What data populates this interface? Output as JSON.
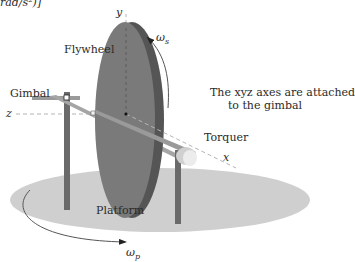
{
  "header_fragment": "rad/s²)]",
  "labels": {
    "flywheel": "Flywheel",
    "gimbal": "Gimbal",
    "torquer": "Torquer",
    "platform": "Platform",
    "note_line1": "The xyz axes are attached",
    "note_line2": "to the gimbal"
  },
  "axes": {
    "x": "x",
    "y": "y",
    "z": "z"
  },
  "angular_velocities": {
    "spin": {
      "symbol": "ω",
      "subscript": "s"
    },
    "platform": {
      "symbol": "ω",
      "subscript": "p"
    }
  },
  "colors": {
    "flywheel_face": "#7a7a7a",
    "flywheel_rim": "#555555",
    "gimbal_bar": "#9a9a9a",
    "post": "#6a6a6a",
    "platform": "#cfcfcf",
    "torquer": "#e2e2e2",
    "axis_dash": "#b5b5b5",
    "text": "#2a2a2a"
  }
}
